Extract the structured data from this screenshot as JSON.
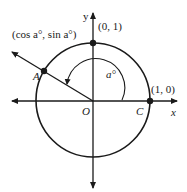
{
  "diagram": {
    "type": "unit-circle",
    "colors": {
      "stroke": "#1a1a1a",
      "background": "#ffffff"
    },
    "axes": {
      "x_label": "x",
      "y_label": "y"
    },
    "points": {
      "top": {
        "label": "(0, 1)"
      },
      "right": {
        "label": "(1, 0)",
        "letter": "C"
      },
      "A": {
        "letter": "A",
        "coords_label": "(cos a°, sin a°)"
      },
      "origin": {
        "letter": "O"
      }
    },
    "angle": {
      "label": "a°"
    }
  }
}
